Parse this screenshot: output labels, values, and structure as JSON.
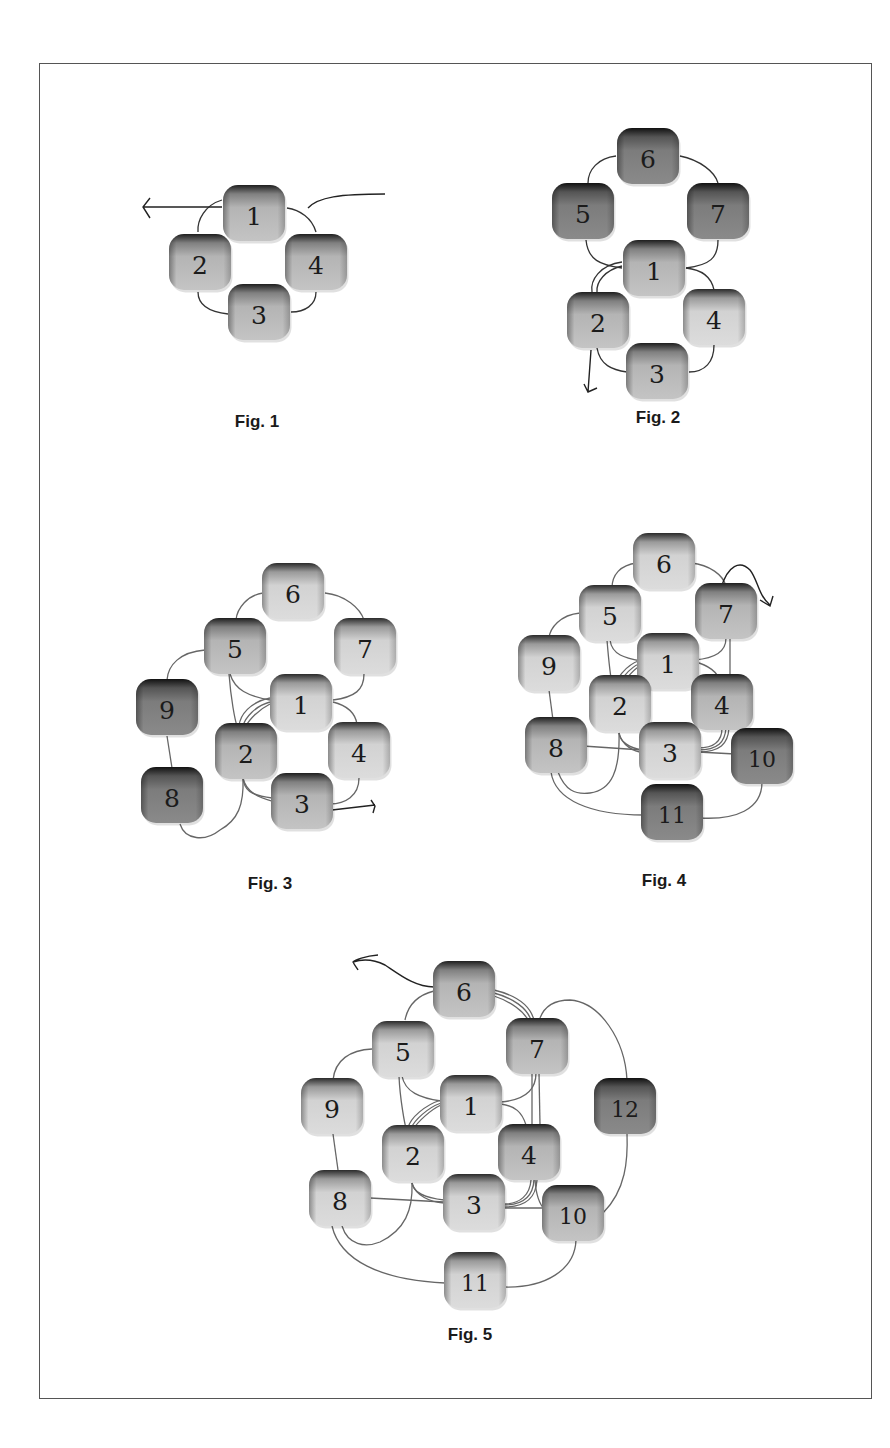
{
  "page": {
    "frame": {
      "x": 39,
      "y": 63,
      "width": 833,
      "height": 1336
    },
    "colors": {
      "node_light": "#c9c9c9",
      "node_medium": "#a8a8a8",
      "node_dark": "#7a7a7a",
      "edge": "#333333",
      "caption": "#1a1a1a"
    }
  },
  "figures": [
    {
      "id": "fig1",
      "caption": "Fig. 1",
      "caption_pos": {
        "x": 257,
        "y": 422
      },
      "nodes": [
        {
          "label": "1",
          "x": 254,
          "y": 213,
          "tone": "medium"
        },
        {
          "label": "2",
          "x": 200,
          "y": 262,
          "tone": "medium"
        },
        {
          "label": "4",
          "x": 316,
          "y": 262,
          "tone": "medium"
        },
        {
          "label": "3",
          "x": 259,
          "y": 312,
          "tone": "medium"
        }
      ],
      "edges": [
        "M222,200 C205,205 197,220 198,232",
        "M287,208 C300,210 312,218 316,232",
        "M198,292 C198,305 210,312 228,314",
        "M291,312 C305,312 316,305 316,292"
      ],
      "arrows": [
        "M222,207 L143,207 M150,198 L143,207 L150,218",
        "M308,208 C318,197 340,194 385,194"
      ]
    },
    {
      "id": "fig2",
      "caption": "Fig. 2",
      "caption_pos": {
        "x": 658,
        "y": 418
      },
      "nodes": [
        {
          "label": "6",
          "x": 648,
          "y": 156,
          "tone": "dark"
        },
        {
          "label": "5",
          "x": 583,
          "y": 211,
          "tone": "dark"
        },
        {
          "label": "7",
          "x": 718,
          "y": 211,
          "tone": "dark"
        },
        {
          "label": "1",
          "x": 654,
          "y": 268,
          "tone": "medium"
        },
        {
          "label": "2",
          "x": 598,
          "y": 320,
          "tone": "medium"
        },
        {
          "label": "4",
          "x": 714,
          "y": 317,
          "tone": "light"
        },
        {
          "label": "3",
          "x": 657,
          "y": 371,
          "tone": "medium"
        }
      ],
      "edges": [
        "M616,156 C598,158 588,170 588,183",
        "M680,156 C700,160 715,172 718,183",
        "M586,240 C588,260 600,265 622,268",
        "M718,240 C718,258 710,265 686,268",
        "M622,262 C600,265 590,280 592,292",
        "M622,266 C605,270 596,282 597,292",
        "M686,268 C705,270 712,280 714,290",
        "M597,348 C600,365 612,370 627,372",
        "M689,372 C705,372 714,362 714,345"
      ],
      "arrows": [
        "M591,350 L588,392 M584,384 L588,392 L597,388"
      ]
    },
    {
      "id": "fig3",
      "caption": "Fig. 3",
      "caption_pos": {
        "x": 270,
        "y": 884
      },
      "nodes": [
        {
          "label": "6",
          "x": 293,
          "y": 591,
          "tone": "light"
        },
        {
          "label": "5",
          "x": 235,
          "y": 646,
          "tone": "medium"
        },
        {
          "label": "7",
          "x": 365,
          "y": 646,
          "tone": "light"
        },
        {
          "label": "9",
          "x": 167,
          "y": 707,
          "tone": "dark"
        },
        {
          "label": "1",
          "x": 301,
          "y": 702,
          "tone": "light"
        },
        {
          "label": "2",
          "x": 246,
          "y": 751,
          "tone": "medium"
        },
        {
          "label": "4",
          "x": 359,
          "y": 750,
          "tone": "light"
        },
        {
          "label": "8",
          "x": 172,
          "y": 795,
          "tone": "dark"
        },
        {
          "label": "3",
          "x": 302,
          "y": 801,
          "tone": "medium"
        }
      ],
      "edges": [
        "M263,593 C248,595 237,608 236,620",
        "M325,593 C345,595 360,608 364,620",
        "M205,650 C180,652 168,665 167,680",
        "M230,674 C235,690 248,696 270,700",
        "M364,674 C364,690 355,697 333,700",
        "M229,674 C231,700 235,720 237,726",
        "M270,698 C250,702 240,715 239,726",
        "M270,702 C255,706 245,718 243,726",
        "M270,704 C258,710 249,720 246,726",
        "M333,702 C345,705 355,712 357,724",
        "M167,736 L172,768",
        "M243,778 C244,790 250,795 272,798",
        "M243,778 C246,792 258,797 272,801",
        "M330,804 C345,804 359,796 359,778",
        "M180,824 C185,840 205,842 220,830 C238,820 244,805 243,778"
      ],
      "arrows": [
        "M332,810 L375,805 M371,800 L375,806 L373,813"
      ]
    },
    {
      "id": "fig4",
      "caption": "Fig. 4",
      "caption_pos": {
        "x": 664,
        "y": 881
      },
      "nodes": [
        {
          "label": "6",
          "x": 664,
          "y": 561,
          "tone": "light"
        },
        {
          "label": "5",
          "x": 610,
          "y": 613,
          "tone": "light"
        },
        {
          "label": "7",
          "x": 726,
          "y": 611,
          "tone": "medium"
        },
        {
          "label": "9",
          "x": 549,
          "y": 663,
          "tone": "light"
        },
        {
          "label": "1",
          "x": 668,
          "y": 661,
          "tone": "light"
        },
        {
          "label": "2",
          "x": 620,
          "y": 703,
          "tone": "light"
        },
        {
          "label": "4",
          "x": 722,
          "y": 702,
          "tone": "medium"
        },
        {
          "label": "8",
          "x": 556,
          "y": 745,
          "tone": "medium"
        },
        {
          "label": "3",
          "x": 670,
          "y": 750,
          "tone": "light"
        },
        {
          "label": "10",
          "x": 762,
          "y": 756,
          "tone": "dark"
        },
        {
          "label": "11",
          "x": 672,
          "y": 812,
          "tone": "dark"
        }
      ],
      "edges": [
        "M637,563 C620,565 612,575 612,588",
        "M691,563 C710,565 723,575 726,586",
        "M580,613 C560,615 550,628 549,638",
        "M610,640 C612,655 625,658 641,661",
        "M726,638 C726,652 715,658 695,660",
        "M607,640 C609,665 612,685 613,690",
        "M641,660 C625,665 615,680 614,690",
        "M641,663 C628,668 619,682 617,690",
        "M641,665 C630,672 622,684 620,690",
        "M695,662 C708,665 718,672 720,682",
        "M730,638 L730,680",
        "M549,690 L553,720",
        "M583,746 L642,750",
        "M619,733 C620,742 630,748 642,750",
        "M619,733 C622,746 635,752 642,752",
        "M698,748 C715,748 722,740 722,728",
        "M698,750 C718,750 725,742 726,728",
        "M698,752 C720,752 728,744 729,728",
        "M698,752 L735,754",
        "M558,772 C565,790 575,795 590,793 C612,790 620,770 619,733",
        "M551,772 C555,800 590,815 644,815",
        "M700,818 C735,820 762,810 762,782"
      ],
      "arrows": [
        "M721,588 C728,565 740,560 750,570 C758,580 758,595 770,605 M760,600 L770,606 L773,596"
      ]
    },
    {
      "id": "fig5",
      "caption": "Fig. 5",
      "caption_pos": {
        "x": 470,
        "y": 1335
      },
      "nodes": [
        {
          "label": "6",
          "x": 464,
          "y": 989,
          "tone": "medium"
        },
        {
          "label": "5",
          "x": 403,
          "y": 1049,
          "tone": "light"
        },
        {
          "label": "7",
          "x": 537,
          "y": 1046,
          "tone": "medium"
        },
        {
          "label": "9",
          "x": 332,
          "y": 1106,
          "tone": "light"
        },
        {
          "label": "1",
          "x": 471,
          "y": 1103,
          "tone": "light"
        },
        {
          "label": "12",
          "x": 625,
          "y": 1106,
          "tone": "dark"
        },
        {
          "label": "2",
          "x": 413,
          "y": 1153,
          "tone": "light"
        },
        {
          "label": "4",
          "x": 529,
          "y": 1152,
          "tone": "medium"
        },
        {
          "label": "8",
          "x": 340,
          "y": 1198,
          "tone": "light"
        },
        {
          "label": "3",
          "x": 474,
          "y": 1202,
          "tone": "light"
        },
        {
          "label": "10",
          "x": 573,
          "y": 1213,
          "tone": "medium"
        },
        {
          "label": "11",
          "x": 475,
          "y": 1280,
          "tone": "light"
        }
      ],
      "edges": [
        "M434,991 C418,995 408,1005 405,1020",
        "M494,990 C515,995 530,1005 534,1020",
        "M494,993 C513,998 527,1008 531,1020",
        "M494,996 C512,1002 524,1012 528,1020",
        "M540,1018 C545,1005 555,1000 570,1000 C600,1002 625,1040 627,1080",
        "M372,1049 C350,1050 335,1060 333,1080",
        "M402,1076 C405,1092 420,1098 441,1101",
        "M536,1073 C536,1090 525,1100 501,1102",
        "M399,1076 C400,1100 405,1125 406,1128",
        "M441,1100 C425,1105 410,1118 408,1128",
        "M441,1103 C427,1108 415,1120 411,1128",
        "M441,1105 C430,1110 418,1122 414,1128",
        "M501,1104 C515,1106 522,1112 526,1125",
        "M532,1073 L532,1125",
        "M539,1073 L540,1125",
        "M333,1134 L338,1170",
        "M370,1198 L444,1202",
        "M412,1183 C413,1192 425,1198 444,1200",
        "M412,1183 C416,1196 430,1202 444,1203",
        "M504,1204 C520,1204 530,1195 531,1180",
        "M504,1205 C523,1205 533,1196 534,1180",
        "M504,1207 C526,1207 536,1198 537,1180",
        "M504,1208 L545,1208",
        "M535,1180 C536,1195 540,1205 545,1210",
        "M627,1133 C628,1160 626,1190 603,1213",
        "M342,1226 C348,1245 365,1248 380,1242 C405,1230 413,1210 412,1183",
        "M332,1226 C340,1260 380,1280 445,1283",
        "M505,1287 C545,1288 575,1270 576,1240"
      ],
      "arrows": [
        "M434,987 C415,987 400,975 385,965 C375,960 365,958 353,962 M378,955 C365,956 355,960 353,962 C355,966 357,968 358,970"
      ]
    }
  ]
}
